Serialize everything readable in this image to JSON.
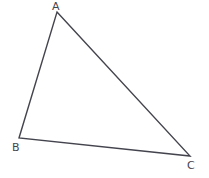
{
  "figure": {
    "kind": "geometry-diagram",
    "shape_name": "triangle",
    "background_color": "#ffffff",
    "stroke_color": "#44444e",
    "stroke_width": 1.4,
    "canvas": {
      "width": 209,
      "height": 178
    },
    "vertices": [
      {
        "id": "A",
        "label": "A",
        "x": 57,
        "y": 12,
        "label_x": 52,
        "label_y": 1,
        "role": "apex"
      },
      {
        "id": "B",
        "label": "B",
        "x": 19,
        "y": 138,
        "label_x": 12,
        "label_y": 142,
        "role": "bottom-left"
      },
      {
        "id": "C",
        "label": "C",
        "x": 190,
        "y": 156,
        "label_x": 187,
        "label_y": 160,
        "role": "bottom-right"
      }
    ],
    "edges": [
      {
        "id": "AB",
        "from": "A",
        "to": "B"
      },
      {
        "id": "AC",
        "from": "A",
        "to": "C"
      },
      {
        "id": "BC",
        "from": "B",
        "to": "C"
      }
    ],
    "polygon_points": "57,12 190,156 19,138"
  }
}
